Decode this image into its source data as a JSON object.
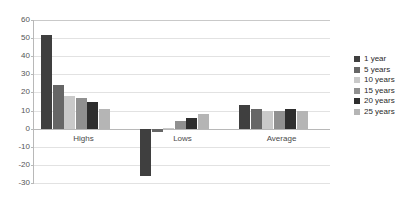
{
  "chart_data": {
    "type": "bar",
    "title": "",
    "subtitle": "",
    "xlabel": "",
    "ylabel": "",
    "categories": [
      "Highs",
      "Lows",
      "Average"
    ],
    "series": [
      {
        "name": "1 year",
        "values": [
          52,
          -26,
          13
        ],
        "color": "#3f3f3f"
      },
      {
        "name": "5 years",
        "values": [
          24,
          -2,
          11
        ],
        "color": "#666666"
      },
      {
        "name": "10 years",
        "values": [
          18,
          0.5,
          10
        ],
        "color": "#c9c9c9"
      },
      {
        "name": "15 years",
        "values": [
          17,
          4,
          10
        ],
        "color": "#909090"
      },
      {
        "name": "20 years",
        "values": [
          15,
          6,
          11
        ],
        "color": "#2e2e2e"
      },
      {
        "name": "25 years",
        "values": [
          11,
          8,
          10
        ],
        "color": "#b5b5b5"
      }
    ],
    "ylim": [
      -30,
      60
    ],
    "yticks": [
      60,
      50,
      40,
      30,
      20,
      10,
      0,
      -10,
      -20,
      -30
    ],
    "ytick_labels": [
      "60",
      "50",
      "40",
      "30",
      "20",
      "10",
      "0",
      "-10",
      "-20",
      "-30"
    ],
    "grid": true,
    "legend_position": "right",
    "orientation": "vertical",
    "grouping": "clustered"
  },
  "legend": {
    "items": [
      {
        "label": "1 year",
        "color": "#3f3f3f"
      },
      {
        "label": "5 years",
        "color": "#666666"
      },
      {
        "label": "10 years",
        "color": "#c9c9c9"
      },
      {
        "label": "15 years",
        "color": "#909090"
      },
      {
        "label": "20 years",
        "color": "#2e2e2e"
      },
      {
        "label": "25 years",
        "color": "#b5b5b5"
      }
    ]
  }
}
